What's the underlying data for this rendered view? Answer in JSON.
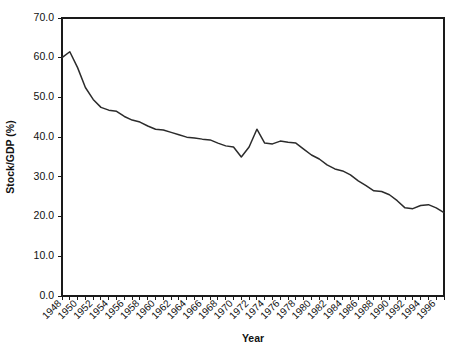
{
  "chart_data": {
    "type": "line",
    "title": "",
    "xlabel": "Year",
    "ylabel": "Stock/GDP (%)",
    "xlim": [
      1948,
      1997
    ],
    "ylim": [
      0.0,
      70.0
    ],
    "grid": false,
    "legend": null,
    "ytick_labels": [
      "70.0",
      "60.0",
      "50.0",
      "40.0",
      "30.0",
      "20.0",
      "10.0",
      "0.0"
    ],
    "ytick_values": [
      70.0,
      60.0,
      50.0,
      40.0,
      30.0,
      20.0,
      10.0,
      0.0
    ],
    "xtick_labels": [
      "1948",
      "1950",
      "1952",
      "1954",
      "1956",
      "1958",
      "1960",
      "1962",
      "1964",
      "1966",
      "1968",
      "1970",
      "1972",
      "1974",
      "1976",
      "1978",
      "1980",
      "1982",
      "1984",
      "1986",
      "1988",
      "1990",
      "1992",
      "1994",
      "1996"
    ],
    "xtick_values": [
      1948,
      1950,
      1952,
      1954,
      1956,
      1958,
      1960,
      1962,
      1964,
      1966,
      1968,
      1970,
      1972,
      1974,
      1976,
      1978,
      1980,
      1982,
      1984,
      1986,
      1988,
      1990,
      1992,
      1994,
      1996
    ],
    "minor_xticks": [
      1948,
      1949,
      1950,
      1951,
      1952,
      1953,
      1954,
      1955,
      1956,
      1957,
      1958,
      1959,
      1960,
      1961,
      1962,
      1963,
      1964,
      1965,
      1966,
      1967,
      1968,
      1969,
      1970,
      1971,
      1972,
      1973,
      1974,
      1975,
      1976,
      1977,
      1978,
      1979,
      1980,
      1981,
      1982,
      1983,
      1984,
      1985,
      1986,
      1987,
      1988,
      1989,
      1990,
      1991,
      1992,
      1993,
      1994,
      1995,
      1996,
      1997
    ],
    "line_color": "#2b2b2b",
    "series": [
      {
        "name": "Stock/GDP",
        "x": [
          1948,
          1949,
          1950,
          1951,
          1952,
          1953,
          1954,
          1955,
          1956,
          1957,
          1958,
          1959,
          1960,
          1961,
          1962,
          1963,
          1964,
          1965,
          1966,
          1967,
          1968,
          1969,
          1970,
          1971,
          1972,
          1973,
          1974,
          1975,
          1976,
          1977,
          1978,
          1979,
          1980,
          1981,
          1982,
          1983,
          1984,
          1985,
          1986,
          1987,
          1988,
          1989,
          1990,
          1991,
          1992,
          1993,
          1994,
          1995,
          1996,
          1997
        ],
        "values": [
          60.0,
          61.5,
          57.5,
          52.5,
          49.5,
          47.5,
          46.8,
          46.5,
          45.2,
          44.3,
          43.8,
          42.8,
          42.0,
          41.8,
          41.2,
          40.6,
          40.0,
          39.8,
          39.5,
          39.3,
          38.5,
          37.8,
          37.5,
          35.0,
          37.5,
          42.0,
          38.5,
          38.3,
          39.0,
          38.7,
          38.5,
          37.0,
          35.5,
          34.5,
          33.0,
          32.0,
          31.5,
          30.5,
          29.0,
          27.8,
          26.5,
          26.3,
          25.5,
          24.0,
          22.2,
          22.0,
          22.8,
          23.0,
          22.2,
          21.0
        ]
      }
    ]
  },
  "plot_geometry": {
    "left": 62,
    "right": 444,
    "top": 18,
    "bottom": 296
  }
}
